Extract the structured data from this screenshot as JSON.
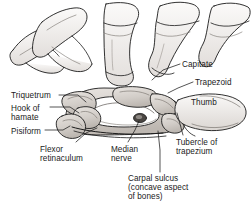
{
  "figure": {
    "background_color": "#ffffff",
    "ink_color": "#1b1b1b",
    "bone_fill_light": "#f3f1ef",
    "bone_fill_mid": "#d9d5d1",
    "bone_fill_shadow": "#b5b0ab",
    "nerve_fill": "#4a4642"
  },
  "labels": [
    {
      "id": "triquetrum",
      "text": "Triquetrum",
      "x": 11,
      "y": 91,
      "align": "left"
    },
    {
      "id": "hook-of-hamate",
      "text": "Hook of\nhamate",
      "x": 11,
      "y": 104,
      "align": "left"
    },
    {
      "id": "pisiform",
      "text": "Pisiform",
      "x": 11,
      "y": 127,
      "align": "left"
    },
    {
      "id": "flexor-retinaculum",
      "text": "Flexor\nretinaculum",
      "x": 40,
      "y": 145,
      "align": "left"
    },
    {
      "id": "median-nerve",
      "text": "Median\nnerve",
      "x": 111,
      "y": 145,
      "align": "left"
    },
    {
      "id": "capitate",
      "text": "Capitate",
      "x": 182,
      "y": 60,
      "align": "left"
    },
    {
      "id": "trapezoid",
      "text": "Trapezoid",
      "x": 195,
      "y": 78,
      "align": "left"
    },
    {
      "id": "thumb",
      "text": "Thumb",
      "x": 191,
      "y": 98,
      "align": "left"
    },
    {
      "id": "tubercle-of-trapezium",
      "text": "Tubercle of\ntrapezium",
      "x": 176,
      "y": 138,
      "align": "left"
    },
    {
      "id": "carpal-sulcus",
      "text": "Carpal sulcus\n(concave aspect\nof bones)",
      "x": 128,
      "y": 174,
      "align": "left"
    }
  ],
  "leader_lines": [
    {
      "id": "triquetrum",
      "points": "59,95 78,95 86,102"
    },
    {
      "id": "hook-of-hamate",
      "points": "50,107 70,107 79,113"
    },
    {
      "id": "pisiform",
      "points": "45,130 63,130 70,126"
    },
    {
      "id": "flexor-retinaculum",
      "points": "76,142 86,133 97,128"
    },
    {
      "id": "median-nerve",
      "points": "128,142 135,130 139,121"
    },
    {
      "id": "capitate",
      "points": "180,64 163,70 152,80"
    },
    {
      "id": "trapezoid",
      "points": "193,82 178,88 168,93"
    },
    {
      "id": "tubercle-of-trapezium",
      "points": "183,135 180,124 177,113"
    },
    {
      "id": "carpal-sulcus",
      "points": "160,172 160,150 158,131"
    }
  ],
  "anatomy_parts": [
    "metacarpal-1-thumb",
    "metacarpal-2",
    "metacarpal-3",
    "metacarpal-4",
    "metacarpal-5",
    "triquetrum-bone",
    "hamate-hook-bone",
    "pisiform-bone",
    "capitate-bone",
    "trapezoid-bone",
    "trapezium-tubercle-bone",
    "carpal-sulcus-arch",
    "flexor-retinaculum-band",
    "median-nerve-oval"
  ]
}
